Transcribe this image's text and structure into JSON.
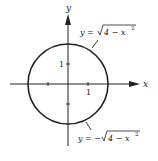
{
  "diagram": {
    "axes": {
      "x_label": "x",
      "y_label": "y",
      "x_tick_label": "1",
      "y_tick_label": "1"
    },
    "curves": [
      {
        "name": "upper-semicircle",
        "label": "y = √(4 − x²)",
        "lhs": "y = ",
        "root": "4 − x",
        "exp": "2"
      },
      {
        "name": "lower-semicircle",
        "label": "y = −√(4 − x²)",
        "lhs": "y = −",
        "root": "4 − x",
        "exp": "2"
      }
    ],
    "circle": {
      "center": [
        0,
        0
      ],
      "radius": 2
    },
    "colors": {
      "ink": "#222222",
      "background": "#ffffff"
    }
  }
}
